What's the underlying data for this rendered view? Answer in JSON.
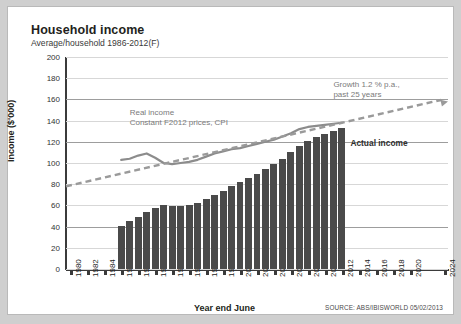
{
  "header": {
    "title": "Household income",
    "subtitle": "Average/household 1986-2012(F)"
  },
  "source": "SOURCE: ABS/IBISWORLD 05/02/2013",
  "annotations": {
    "real_income_line1": "Real income",
    "real_income_line2": "Constant F2012 prices, CPI",
    "growth_line1": "Growth 1.2 % p.a.,",
    "growth_line2": "past 25 years",
    "actual_income": "Actual income"
  },
  "colors": {
    "bar": "#4a4a4a",
    "real_income_line": "#8c8c8c",
    "trend_line": "#9a9a9a",
    "axis": "#3b3b3b",
    "gridline": "#d7d7d7",
    "gridline_major": "#9d9d9d",
    "card_background": "#ffffff",
    "page_background": "#cfcfcf"
  },
  "chart_data": {
    "type": "bar",
    "title": "Household income",
    "subtitle": "Average/household 1986-2012(F)",
    "xlabel": "Year end June",
    "ylabel": "Income ($'000)",
    "ylim": [
      0,
      200
    ],
    "yticks": [
      0,
      20,
      40,
      60,
      80,
      100,
      120,
      140,
      160,
      180,
      200
    ],
    "xlim": [
      1980,
      2025
    ],
    "xticks": [
      1980,
      1982,
      1984,
      1986,
      1988,
      1990,
      1992,
      1994,
      1996,
      1998,
      2000,
      2002,
      2004,
      2006,
      2008,
      2010,
      2012,
      2014,
      2016,
      2018,
      2020,
      2024
    ],
    "grid": true,
    "legend": "none",
    "series": [
      {
        "name": "Actual income",
        "type": "bar",
        "x": [
          1986,
          1987,
          1988,
          1989,
          1990,
          1991,
          1992,
          1993,
          1994,
          1995,
          1996,
          1997,
          1998,
          1999,
          2000,
          2001,
          2002,
          2003,
          2004,
          2005,
          2006,
          2007,
          2008,
          2009,
          2010,
          2011,
          2012
        ],
        "values": [
          41,
          45,
          49,
          54,
          58,
          60,
          59,
          59,
          60,
          62,
          66,
          70,
          74,
          78,
          82,
          86,
          90,
          94,
          99,
          104,
          110,
          116,
          121,
          125,
          127,
          130,
          133
        ]
      },
      {
        "name": "Real income",
        "type": "line",
        "x": [
          1986,
          1987,
          1988,
          1989,
          1990,
          1991,
          1992,
          1993,
          1994,
          1995,
          1996,
          1997,
          1998,
          1999,
          2000,
          2001,
          2002,
          2003,
          2004,
          2005,
          2006,
          2007,
          2008,
          2009,
          2010,
          2011,
          2012
        ],
        "values": [
          103,
          104,
          107,
          109,
          105,
          100,
          99,
          100,
          101,
          103,
          106,
          109,
          111,
          113,
          114,
          116,
          118,
          120,
          122,
          125,
          128,
          132,
          134,
          135,
          136,
          137,
          138
        ]
      },
      {
        "name": "Growth trend 1.2% p.a.",
        "type": "line",
        "style": "dashed",
        "x": [
          1980,
          2025
        ],
        "values": [
          78,
          158
        ]
      }
    ]
  }
}
